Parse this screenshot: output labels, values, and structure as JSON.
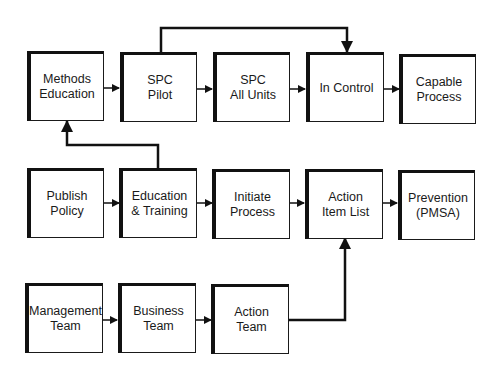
{
  "diagram": {
    "type": "flowchart",
    "nodes": [
      {
        "id": "methods_education",
        "label": "Methods\nEducation",
        "row": 1,
        "col": 1
      },
      {
        "id": "spc_pilot",
        "label": "SPC\nPilot",
        "row": 1,
        "col": 2
      },
      {
        "id": "spc_all_units",
        "label": "SPC\nAll Units",
        "row": 1,
        "col": 3
      },
      {
        "id": "in_control",
        "label": "In Control",
        "row": 1,
        "col": 4
      },
      {
        "id": "capable_process",
        "label": "Capable\nProcess",
        "row": 1,
        "col": 5
      },
      {
        "id": "publish_policy",
        "label": "Publish\nPolicy",
        "row": 2,
        "col": 1
      },
      {
        "id": "education_training",
        "label": "Education\n& Training",
        "row": 2,
        "col": 2
      },
      {
        "id": "initiate_process",
        "label": "Initiate\nProcess",
        "row": 2,
        "col": 3
      },
      {
        "id": "action_item_list",
        "label": "Action\nItem List",
        "row": 2,
        "col": 4
      },
      {
        "id": "prevention",
        "label": "Prevention\n(PMSA)",
        "row": 2,
        "col": 5
      },
      {
        "id": "management_team",
        "label": "Management\nTeam",
        "row": 3,
        "col": 1
      },
      {
        "id": "business_team",
        "label": "Business\nTeam",
        "row": 3,
        "col": 2
      },
      {
        "id": "action_team",
        "label": "Action\nTeam",
        "row": 3,
        "col": 3
      }
    ],
    "edges": [
      {
        "from": "methods_education",
        "to": "spc_pilot"
      },
      {
        "from": "spc_pilot",
        "to": "spc_all_units"
      },
      {
        "from": "spc_all_units",
        "to": "in_control"
      },
      {
        "from": "in_control",
        "to": "capable_process"
      },
      {
        "from": "spc_pilot",
        "to": "in_control"
      },
      {
        "from": "publish_policy",
        "to": "education_training"
      },
      {
        "from": "education_training",
        "to": "initiate_process"
      },
      {
        "from": "initiate_process",
        "to": "action_item_list"
      },
      {
        "from": "action_item_list",
        "to": "prevention"
      },
      {
        "from": "education_training",
        "to": "methods_education"
      },
      {
        "from": "management_team",
        "to": "business_team"
      },
      {
        "from": "business_team",
        "to": "action_team"
      },
      {
        "from": "action_team",
        "to": "action_item_list"
      }
    ]
  }
}
